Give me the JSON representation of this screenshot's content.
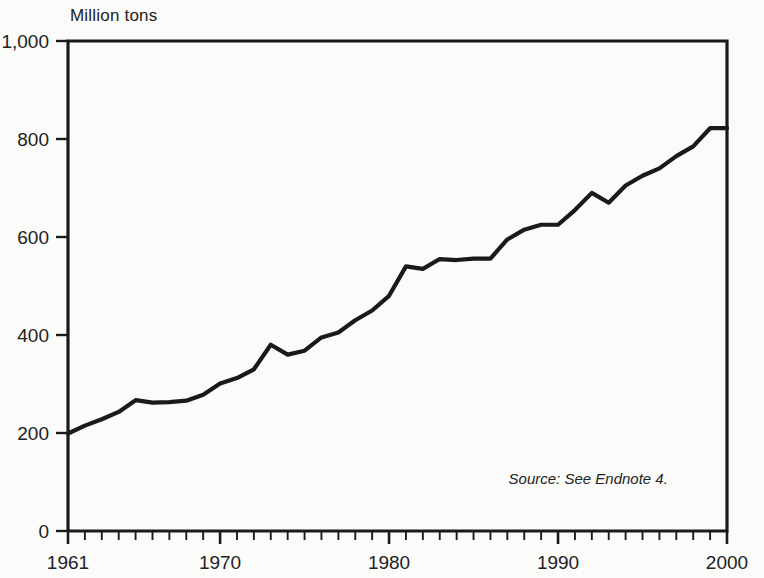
{
  "axis_unit_label": "Million tons",
  "source_note": "Source: See Endnote 4.",
  "chart_data": {
    "type": "line",
    "title": "",
    "subtitle": "",
    "xlabel": "",
    "ylabel": "Million tons",
    "xlim": [
      1961,
      2000
    ],
    "ylim": [
      0,
      1000
    ],
    "grid": false,
    "legend": "none",
    "line_color": "#1a1a1a",
    "axis_color": "#1a1a1a",
    "background_color": "#fbfbfa",
    "ytick_values": [
      0,
      200,
      400,
      600,
      800,
      1000
    ],
    "ytick_labels": [
      "0",
      "200",
      "400",
      "600",
      "800",
      "1,000"
    ],
    "xtick_values": [
      1961,
      1970,
      1980,
      1990,
      2000
    ],
    "xtick_labels": [
      "1961",
      "1970",
      "1980",
      "1990",
      "2000"
    ],
    "minor_xticks_every": 1,
    "annotations": [
      {
        "text": "Source: See Endnote 4.",
        "x": 1996.5,
        "y": 95,
        "style": "italic"
      }
    ],
    "series": [
      {
        "name": "World Fish Catch",
        "x": [
          1961,
          1962,
          1963,
          1964,
          1965,
          1966,
          1967,
          1968,
          1969,
          1970,
          1971,
          1972,
          1973,
          1974,
          1975,
          1976,
          1977,
          1978,
          1979,
          1980,
          1981,
          1982,
          1983,
          1984,
          1985,
          1986,
          1987,
          1988,
          1989,
          1990,
          1991,
          1992,
          1993,
          1994,
          1995,
          1996,
          1997,
          1998,
          1999,
          2000
        ],
        "values": [
          199,
          215,
          228,
          243,
          267,
          262,
          263,
          266,
          278,
          301,
          312,
          330,
          380,
          360,
          368,
          395,
          405,
          430,
          450,
          480,
          540,
          535,
          555,
          553,
          556,
          556,
          595,
          615,
          625,
          625,
          655,
          690,
          670,
          705,
          725,
          740,
          765,
          785,
          822,
          822
        ]
      }
    ]
  }
}
